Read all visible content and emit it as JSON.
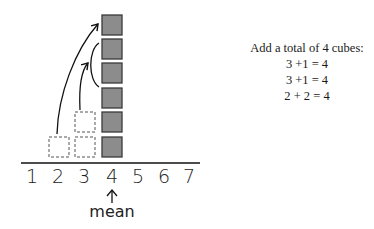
{
  "diagram": {
    "number_line": {
      "labels": [
        "1",
        "2",
        "3",
        "4",
        "5",
        "6",
        "7"
      ],
      "label_positions_x": [
        32,
        58,
        84,
        112,
        138,
        164,
        189
      ]
    },
    "mean_label": "mean",
    "mean_value": 4,
    "stack": {
      "position": 4,
      "solid_cubes": 6,
      "cube_fill": "#8c8c8c",
      "cube_border": "#3a3a3a"
    },
    "moved_cubes": [
      {
        "from_position": 2,
        "level": 1,
        "style": "dashed"
      },
      {
        "from_position": 3,
        "level": 1,
        "style": "dashed"
      },
      {
        "from_position": 3,
        "level": 2,
        "style": "dashed"
      }
    ]
  },
  "notes": {
    "heading": "Add a total of 4 cubes:",
    "lines": [
      "3 +1 = 4",
      "3 +1 = 4",
      "2 + 2 = 4"
    ]
  }
}
